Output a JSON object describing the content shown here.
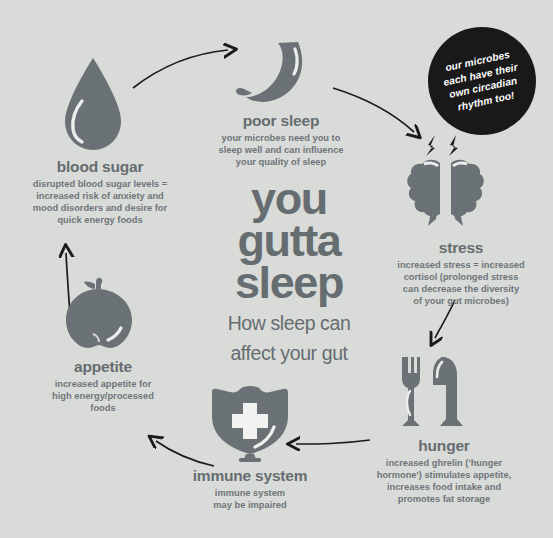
{
  "background_color": "#d9dbd8",
  "icon_color": "#6b7276",
  "text_color": "#6e757a",
  "heading_color": "#666d71",
  "badge": {
    "background": "#191919",
    "text_color": "#ffffff",
    "lines": [
      "our microbes",
      "each have their",
      "own circadian",
      "rhythm too!"
    ],
    "text": "our microbes each have their own circadian rhythm too!"
  },
  "center": {
    "title_lines": [
      "you",
      "gutta",
      "sleep"
    ],
    "title": "you gutta sleep",
    "subtitle_lines": [
      "How sleep can",
      "affect your gut"
    ],
    "subtitle": "How sleep can affect your gut"
  },
  "nodes": [
    {
      "id": "poor-sleep",
      "icon": "crescent-moon-icon",
      "title": "poor sleep",
      "desc_lines": [
        "your microbes need you to",
        "sleep well and can influence",
        "your quality of sleep"
      ],
      "desc": "your microbes need you to sleep well and can influence your quality of sleep"
    },
    {
      "id": "stress",
      "icon": "split-brain-lightning-icon",
      "title": "stress",
      "desc_lines": [
        "increased stress = increased",
        "cortisol (prolonged stress",
        "can decrease the diversity",
        "of your gut microbes)"
      ],
      "desc": "increased stress = increased cortisol (prolonged stress can decrease the diversity of your gut microbes)"
    },
    {
      "id": "hunger",
      "icon": "fork-and-knife-icon",
      "title": "hunger",
      "desc_lines": [
        "increased ghrelin ('hunger",
        "hormone') stimulates appetite,",
        "increases food intake and",
        "promotes fat storage"
      ],
      "desc": "increased ghrelin ('hunger hormone') stimulates appetite, increases food intake and promotes fat storage"
    },
    {
      "id": "immune-system",
      "icon": "shield-cross-icon",
      "title": "immune system",
      "desc_lines": [
        "immune system",
        "may be impaired"
      ],
      "desc": "immune system may be impaired"
    },
    {
      "id": "appetite",
      "icon": "apple-icon",
      "title": "appetite",
      "desc_lines": [
        "increased appetite for",
        "high energy/processed",
        "foods"
      ],
      "desc": "increased appetite for high energy/processed foods"
    },
    {
      "id": "blood-sugar",
      "icon": "blood-drop-icon",
      "title": "blood sugar",
      "desc_lines": [
        "disrupted blood sugar levels =",
        "increased risk of anxiety and",
        "mood disorders and desire for",
        "quick energy foods"
      ],
      "desc": "disrupted blood sugar levels = increased risk of anxiety and mood disorders and desire for quick energy foods"
    }
  ],
  "flow": {
    "direction": "clockwise",
    "sequence": [
      "blood sugar",
      "poor sleep",
      "stress",
      "hunger",
      "immune system",
      "appetite",
      "blood sugar"
    ]
  }
}
